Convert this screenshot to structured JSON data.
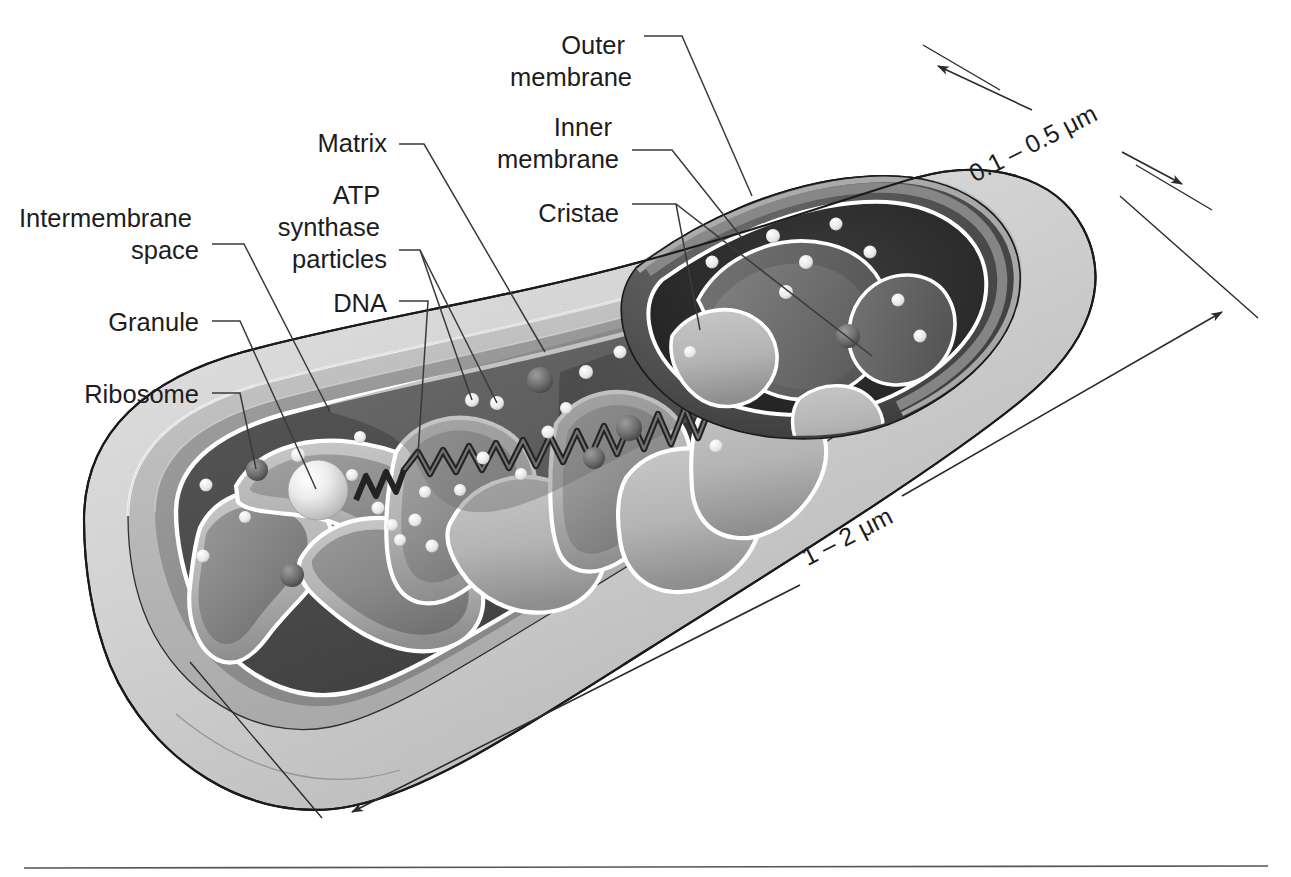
{
  "figure": {
    "view": "three-dimensional cut-away illustration",
    "style": "grayscale halftone textbook art"
  },
  "labels": [
    {
      "id": "outer-membrane",
      "text_lines": [
        "Outer",
        "membrane"
      ],
      "align": "right",
      "x": 632,
      "y": 44,
      "line_h": 32
    },
    {
      "id": "inner-membrane",
      "text_lines": [
        "Inner",
        "membrane"
      ],
      "align": "right",
      "x": 619,
      "y": 126,
      "line_h": 32
    },
    {
      "id": "cristae",
      "text_lines": [
        "Cristae"
      ],
      "align": "right",
      "x": 619,
      "y": 212,
      "line_h": 32
    },
    {
      "id": "matrix",
      "text_lines": [
        "Matrix"
      ],
      "align": "right",
      "x": 387,
      "y": 152,
      "line_h": 32
    },
    {
      "id": "atp-synthase",
      "text_lines": [
        "ATP",
        "synthase",
        "particles"
      ],
      "align": "right",
      "x": 387,
      "y": 196,
      "line_h": 32
    },
    {
      "id": "dna",
      "text_lines": [
        "DNA"
      ],
      "align": "right",
      "x": 387,
      "y": 309,
      "line_h": 32
    },
    {
      "id": "intermembrane-space",
      "text_lines": [
        "Intermembrane",
        "space"
      ],
      "align": "right",
      "x": 199,
      "y": 219,
      "line_h": 32
    },
    {
      "id": "granule",
      "text_lines": [
        "Granule"
      ],
      "align": "right",
      "x": 199,
      "y": 329,
      "line_h": 32
    },
    {
      "id": "ribosome",
      "text_lines": [
        "Ribosome"
      ],
      "align": "right",
      "x": 199,
      "y": 401,
      "line_h": 32
    }
  ],
  "dimensions": [
    {
      "id": "thickness",
      "text": "0.1 – 0.5 μm",
      "x": 1047,
      "y": 120,
      "rotate": -27
    },
    {
      "id": "length",
      "text": "1 – 2 μm",
      "x": 845,
      "y": 560,
      "rotate": -52
    }
  ],
  "structures": [
    {
      "id": "outer-membrane",
      "name": "Outer membrane"
    },
    {
      "id": "inner-membrane",
      "name": "Inner membrane"
    },
    {
      "id": "intermembrane-space",
      "name": "Intermembrane space"
    },
    {
      "id": "matrix",
      "name": "Matrix"
    },
    {
      "id": "cristae",
      "name": "Cristae"
    },
    {
      "id": "granule",
      "name": "Granule"
    },
    {
      "id": "ribosome",
      "name": "Ribosome"
    },
    {
      "id": "dna",
      "name": "DNA"
    },
    {
      "id": "atp-synthase",
      "name": "ATP synthase particles"
    }
  ],
  "colors": {
    "background": "#ffffff",
    "outer_membrane_light": "#d2d2d2",
    "outer_membrane_mid": "#bdbdbd",
    "intermembrane_space": "#9a9a9a",
    "matrix_dark": "#4a4a4a",
    "matrix_deep": "#2e2e2e",
    "crista_face": "#b3b3b3",
    "crista_shade": "#7d7d7d",
    "membrane_white_line": "#ffffff",
    "outline": "#1a1a1a",
    "label_text": "#1d1d1d",
    "leader_line": "#3a3a3a",
    "rule": "#555555"
  },
  "footer_rule": {
    "id": "bottom-rule",
    "x1": 24,
    "x2": 1268,
    "y": 868
  }
}
